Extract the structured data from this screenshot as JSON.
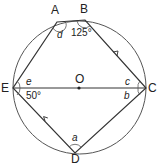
{
  "diagram": {
    "points": {
      "A": "A",
      "B": "B",
      "C": "C",
      "D": "D",
      "E": "E",
      "O": "O"
    },
    "angles": {
      "d": "d",
      "B": "125°",
      "e": "e",
      "E": "50°",
      "c": "c",
      "b": "b",
      "a": "a"
    }
  }
}
